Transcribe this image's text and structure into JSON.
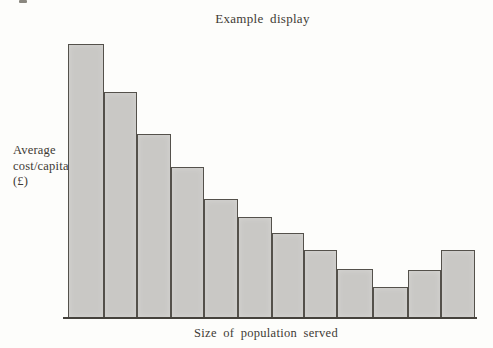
{
  "chart_data": {
    "type": "bar",
    "title": "Example display",
    "xlabel": "Size of population served",
    "ylabel": "Average cost/capita (£)",
    "ylabel_lines": [
      "Average",
      "cost/capita",
      "(£)"
    ],
    "categories": [
      "bar-1",
      "bar-2",
      "bar-3",
      "bar-4",
      "bar-5",
      "bar-6",
      "bar-7",
      "bar-8",
      "bar-9",
      "bar-10",
      "bar-11",
      "bar-12"
    ],
    "values_relative": [
      1.0,
      0.82,
      0.67,
      0.55,
      0.43,
      0.37,
      0.31,
      0.25,
      0.18,
      0.11,
      0.18,
      0.25
    ],
    "bar_heights_px": [
      274,
      226,
      184,
      151,
      119,
      101,
      85,
      68,
      49,
      31,
      48,
      68
    ],
    "bar_edges_px": [
      68,
      104,
      137,
      171,
      204,
      238,
      272,
      304,
      337,
      373,
      408,
      441,
      475
    ],
    "axis": {
      "numeric_ticks_visible": false,
      "gridlines": false,
      "baseline_y_px": 318
    },
    "layout": {
      "bars_touching": true,
      "legend": "none"
    },
    "style": {
      "bar_fill": "#c9c8c5",
      "bar_border": "#54514b",
      "baseline_color": "#45423c",
      "text_color": "#3d3a34",
      "background": "#fdfdfb"
    }
  }
}
